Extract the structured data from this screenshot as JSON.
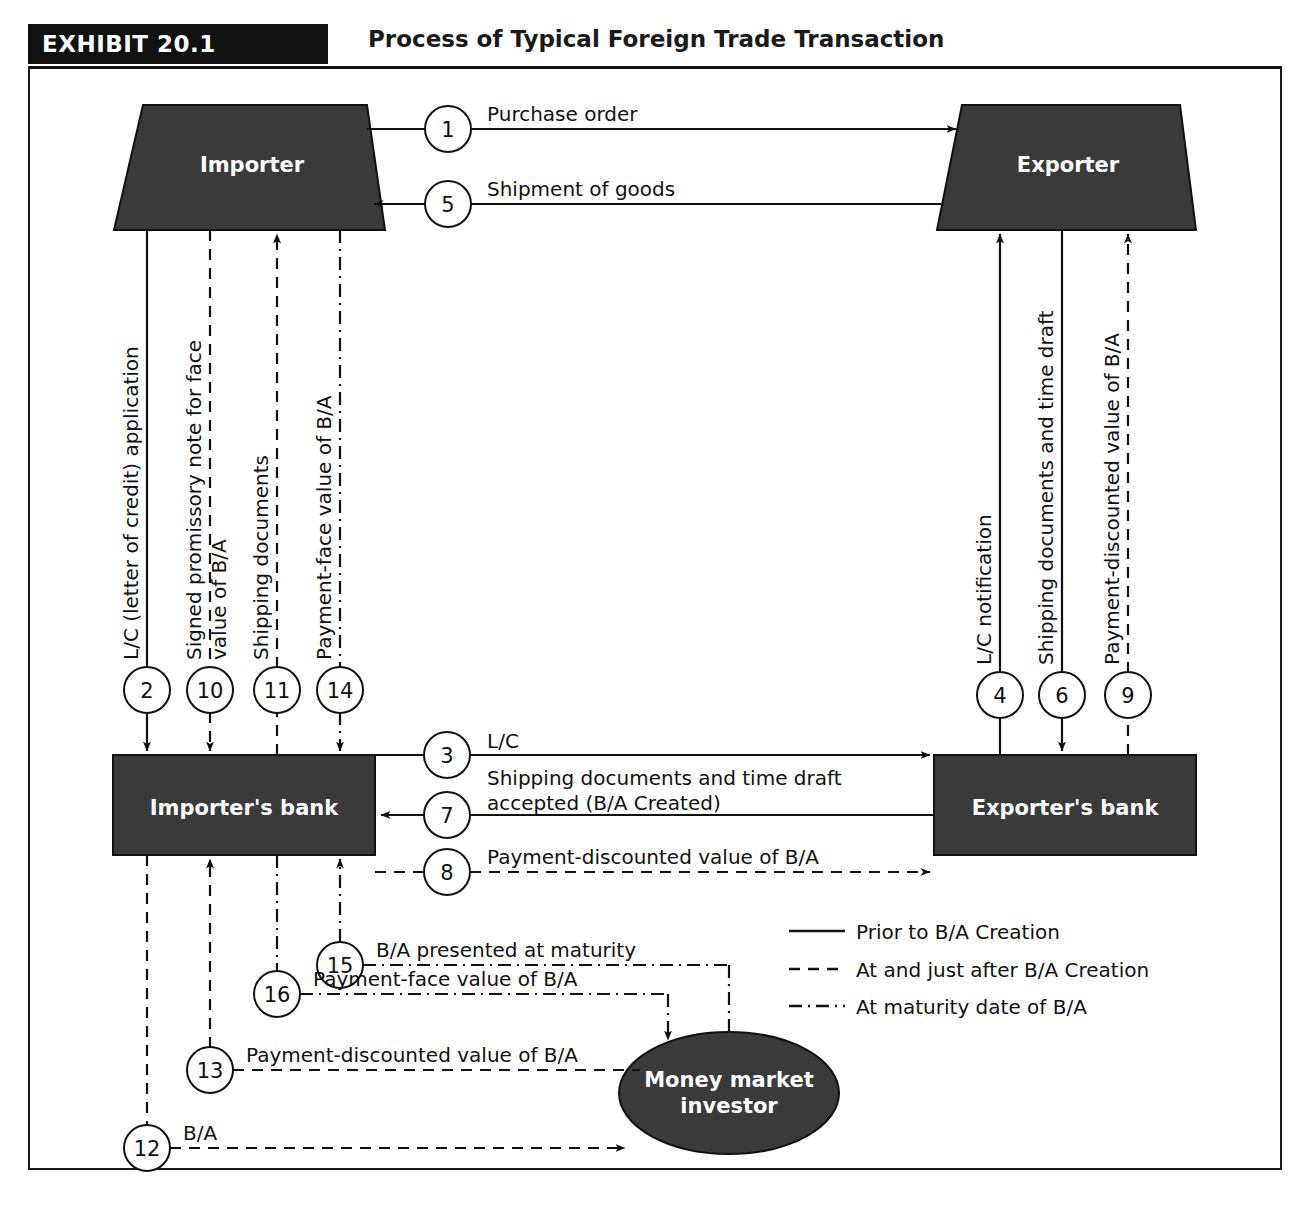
{
  "header": {
    "badge": "EXHIBIT 20.1",
    "title": "Process of Typical Foreign Trade Transaction"
  },
  "nodes": {
    "importer": "Importer",
    "exporter": "Exporter",
    "importer_bank": "Importer's bank",
    "exporter_bank": "Exporter's bank",
    "money_market_line1": "Money market",
    "money_market_line2": "investor"
  },
  "steps": [
    {
      "num": "1",
      "label": "Purchase order"
    },
    {
      "num": "2",
      "label": "L/C (letter of credit) application"
    },
    {
      "num": "3",
      "label": "L/C"
    },
    {
      "num": "4",
      "label": "L/C notification"
    },
    {
      "num": "5",
      "label": "Shipment of goods"
    },
    {
      "num": "6",
      "label": "Shipping documents and time draft"
    },
    {
      "num": "7",
      "label_line1": "Shipping documents and time draft",
      "label_line2": "accepted (B/A Created)"
    },
    {
      "num": "8",
      "label": "Payment-discounted value of B/A"
    },
    {
      "num": "9",
      "label": "Payment-discounted value of B/A"
    },
    {
      "num": "10",
      "label_line1": "Signed promissory note for face",
      "label_line2": "value of B/A"
    },
    {
      "num": "11",
      "label": "Shipping documents"
    },
    {
      "num": "12",
      "label": "B/A"
    },
    {
      "num": "13",
      "label": "Payment-discounted value of B/A"
    },
    {
      "num": "14",
      "label": "Payment-face value of B/A"
    },
    {
      "num": "15",
      "label": "B/A presented at maturity"
    },
    {
      "num": "16",
      "label": "Payment-face value of B/A"
    }
  ],
  "legend": [
    {
      "style": "solid",
      "label": "Prior to B/A Creation"
    },
    {
      "style": "dashed",
      "label": "At and just after B/A Creation"
    },
    {
      "style": "dashdot",
      "label": "At maturity date of B/A"
    }
  ],
  "colors": {
    "node_fill": "#3a3a3a",
    "line": "#111111",
    "badge_bg": "#111111",
    "page_bg": "#ffffff"
  }
}
